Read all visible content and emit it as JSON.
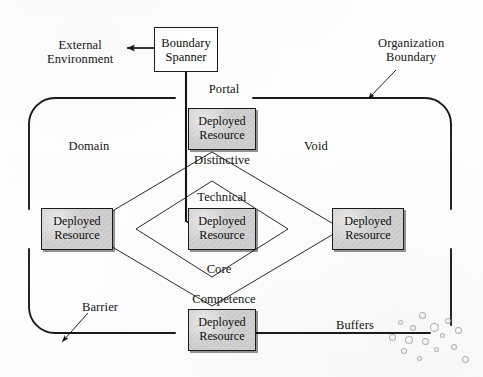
{
  "figure": {
    "title_absent": true,
    "boxes": {
      "boundary_spanner": {
        "line1": "Boundary",
        "line2": "Spanner"
      },
      "deployed_resource": {
        "line1": "Deployed",
        "line2": "Resource"
      }
    },
    "external": {
      "line1": "External",
      "line2": "Environment"
    },
    "organization_boundary": {
      "line1": "Organization",
      "line2": "Boundary"
    },
    "regions": {
      "portal": "Portal",
      "domain": "Domain",
      "void": "Void",
      "barrier": "Barrier",
      "buffers": "Buffers"
    },
    "competence_layers": {
      "distinctive": "Distinctive",
      "technical": "Technical",
      "core": "Core",
      "competence": "Competence"
    },
    "resource_nodes": [
      {
        "position": "top",
        "line1": "Deployed",
        "line2": "Resource"
      },
      {
        "position": "left",
        "line1": "Deployed",
        "line2": "Resource"
      },
      {
        "position": "center",
        "line1": "Deployed",
        "line2": "Resource"
      },
      {
        "position": "right",
        "line1": "Deployed",
        "line2": "Resource"
      },
      {
        "position": "bottom",
        "line1": "Deployed",
        "line2": "Resource"
      }
    ],
    "colors": {
      "ink": "#141414",
      "resource_fill": "#d2d2d2",
      "paper": "#ffffff",
      "boundary_stroke": "#1a1a1a"
    }
  }
}
